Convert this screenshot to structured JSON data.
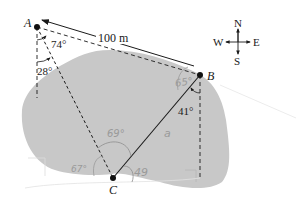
{
  "points": {
    "A": {
      "label": "A",
      "x": 37,
      "y": 27
    },
    "B": {
      "label": "B",
      "x": 200,
      "y": 75
    },
    "C": {
      "label": "C",
      "x": 113,
      "y": 178
    }
  },
  "distance_label": "100 m",
  "side_label": "a",
  "angles": {
    "A_top": "74°",
    "A_bottom": "28°",
    "B": "41°"
  },
  "handwritten": {
    "near_B": "65°",
    "C_top": "69°",
    "C_left": "67°",
    "C_right": "49"
  },
  "compass": {
    "N": "N",
    "S": "S",
    "E": "E",
    "W": "W"
  },
  "colors": {
    "land": "#c8c8c8",
    "ink": "#1a1a1a",
    "pencil": "#9a9a9a"
  }
}
